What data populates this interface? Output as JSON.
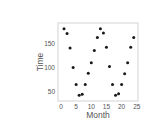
{
  "chart_data": {
    "type": "scatter",
    "title": "",
    "xlabel": "Month",
    "ylabel": "Time",
    "xlim": [
      -0.8,
      25.8
    ],
    "ylim": [
      35,
      190
    ],
    "xticks": [
      0,
      5,
      10,
      15,
      20,
      25
    ],
    "yticks": [
      50,
      100,
      150
    ],
    "grid": false,
    "legend": null,
    "marker_color": "#1a1a1a",
    "x": [
      1,
      2,
      3,
      4,
      5,
      6,
      7,
      8,
      9,
      10,
      11,
      12,
      13,
      14,
      15,
      16,
      17,
      18,
      19,
      20,
      21,
      22,
      23,
      24
    ],
    "y": [
      180,
      170,
      140,
      100,
      65,
      43,
      45,
      65,
      88,
      110,
      135,
      162,
      180,
      171,
      142,
      102,
      65,
      43,
      46,
      65,
      87,
      110,
      142,
      162
    ]
  }
}
